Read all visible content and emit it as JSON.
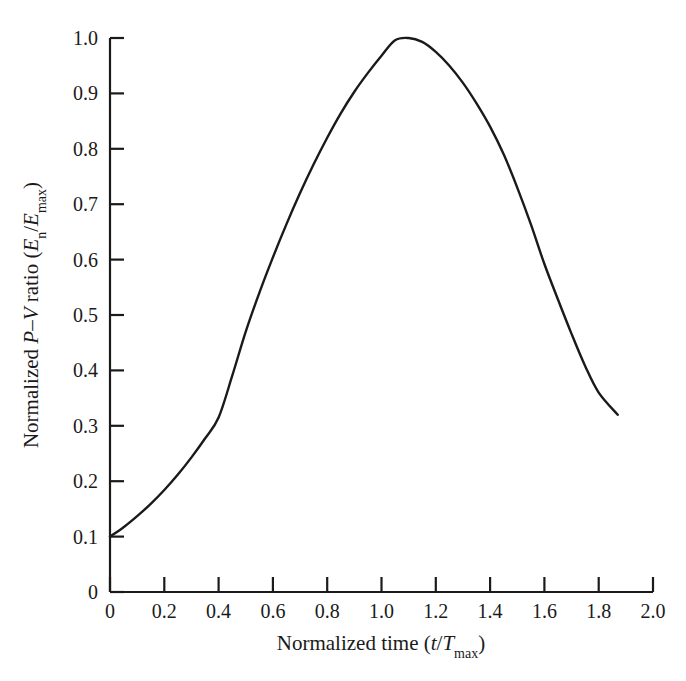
{
  "figure": {
    "background_color": "#ffffff",
    "line_color": "#1a1a1a"
  },
  "chart_data": {
    "type": "line",
    "title": "",
    "subtitle": "",
    "xlabel_plain": "Normalized time (t/Tmax)",
    "ylabel_plain": "Normalized P-V ratio (En/Emax)",
    "xlabel_parts": {
      "prefix": "Normalized time (",
      "var_t": "t",
      "slash": "/",
      "var_T": "T",
      "sub_T": "max",
      "suffix": ")"
    },
    "ylabel_parts": {
      "prefix": "Normalized ",
      "var_P": "P",
      "dash": "–",
      "var_V": "V",
      "mid": " ratio (",
      "var_E1": "E",
      "sub_E1": "n",
      "slash": "/",
      "var_E2": "E",
      "sub_E2": "max",
      "suffix": ")"
    },
    "xlim": [
      0,
      2.0
    ],
    "ylim": [
      0,
      1.0
    ],
    "xticks": [
      0,
      0.2,
      0.4,
      0.6,
      0.8,
      1.0,
      1.2,
      1.4,
      1.6,
      1.8,
      2.0
    ],
    "xticklabels": [
      "0",
      "0.2",
      "0.4",
      "0.6",
      "0.8",
      "1.0",
      "1.2",
      "1.4",
      "1.6",
      "1.8",
      "2.0"
    ],
    "yticks": [
      0,
      0.1,
      0.2,
      0.3,
      0.4,
      0.5,
      0.6,
      0.7,
      0.8,
      0.9,
      1.0
    ],
    "yticklabels": [
      "0",
      "0.1",
      "0.2",
      "0.3",
      "0.4",
      "0.5",
      "0.6",
      "0.7",
      "0.8",
      "0.9",
      "1.0"
    ],
    "grid": false,
    "legend": false,
    "legend_position": "none",
    "tick_direction": "in",
    "series": [
      {
        "name": "Normalized P-V ratio",
        "color": "#1a1a1a",
        "linewidth": 2.4,
        "x": [
          0.0,
          0.05,
          0.1,
          0.15,
          0.2,
          0.25,
          0.3,
          0.35,
          0.4,
          0.45,
          0.5,
          0.55,
          0.6,
          0.65,
          0.7,
          0.75,
          0.8,
          0.85,
          0.9,
          0.95,
          1.0,
          1.05,
          1.1,
          1.15,
          1.2,
          1.25,
          1.3,
          1.35,
          1.4,
          1.45,
          1.5,
          1.55,
          1.6,
          1.65,
          1.7,
          1.75,
          1.8,
          1.87
        ],
        "y": [
          0.1,
          0.117,
          0.137,
          0.159,
          0.184,
          0.212,
          0.243,
          0.277,
          0.315,
          0.39,
          0.47,
          0.54,
          0.604,
          0.664,
          0.72,
          0.772,
          0.82,
          0.864,
          0.903,
          0.937,
          0.968,
          0.996,
          1.0,
          0.993,
          0.975,
          0.95,
          0.919,
          0.882,
          0.84,
          0.79,
          0.73,
          0.664,
          0.592,
          0.528,
          0.466,
          0.408,
          0.36,
          0.32
        ]
      }
    ],
    "annotations": [],
    "peak": {
      "x": 1.07,
      "y": 1.0
    },
    "start_point": {
      "x": 0.0,
      "y": 0.1
    },
    "end_point": {
      "x": 1.87,
      "y": 0.32
    }
  }
}
